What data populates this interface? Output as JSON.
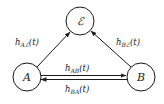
{
  "diagram": {
    "nodes": [
      {
        "id": "E",
        "label": "ℰ"
      },
      {
        "id": "A",
        "label": "A"
      },
      {
        "id": "B",
        "label": "B"
      }
    ],
    "edges": [
      {
        "from": "A",
        "to": "E",
        "label": {
          "base": "h",
          "sub": "Aℰ",
          "arg": "(t)"
        }
      },
      {
        "from": "B",
        "to": "E",
        "label": {
          "base": "h",
          "sub": "Bℰ",
          "arg": "(t)"
        }
      },
      {
        "from": "A",
        "to": "B",
        "label": {
          "base": "h",
          "sub": "AB",
          "arg": "(t)"
        }
      },
      {
        "from": "B",
        "to": "A",
        "label": {
          "base": "h",
          "sub": "BA",
          "arg": "(t)"
        }
      }
    ],
    "colors": {
      "stroke": "#1a1a1a",
      "background": "#ffffff"
    }
  }
}
